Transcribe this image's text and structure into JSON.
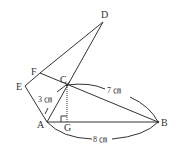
{
  "diagram": {
    "points": {
      "A": {
        "label": "A",
        "x": 47,
        "y": 122
      },
      "B": {
        "label": "B",
        "x": 158,
        "y": 122
      },
      "C": {
        "label": "C",
        "x": 67,
        "y": 85
      },
      "D": {
        "label": "D",
        "x": 103,
        "y": 22
      },
      "E": {
        "label": "E",
        "x": 25,
        "y": 86
      },
      "F": {
        "label": "F",
        "x": 40,
        "y": 73
      },
      "G": {
        "label": "G",
        "x": 67,
        "y": 122
      }
    },
    "measurements": {
      "AC": "3 ㎝",
      "CB": "7 ㎝",
      "AB": "8 ㎝"
    },
    "segments": [
      "A-B",
      "A-C",
      "C-D",
      "C-B",
      "F-D",
      "F-B",
      "E-F",
      "E-A"
    ],
    "dotted": [
      "C-G"
    ],
    "right_angle_at": "G"
  }
}
